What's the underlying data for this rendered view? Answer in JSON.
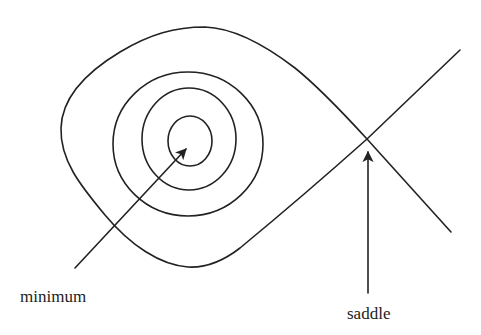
{
  "diagram": {
    "stroke_color": "#222222",
    "background": "#ffffff",
    "labels": {
      "minimum": "minimum",
      "saddle": "saddle"
    },
    "contours": {
      "separatrix": "teardrop-shaped level set crossing itself at the saddle point",
      "closed_loops": [
        {
          "name": "outer-ring",
          "cx": 188,
          "cy": 144,
          "rx": 75,
          "ry": 72
        },
        {
          "name": "middle-ring",
          "cx": 189,
          "cy": 139,
          "rx": 47,
          "ry": 51
        },
        {
          "name": "inner-ring",
          "cx": 190,
          "cy": 141,
          "rx": 22,
          "ry": 25
        }
      ]
    },
    "points": {
      "minimum": {
        "x": 190,
        "y": 141
      },
      "saddle": {
        "x": 367,
        "y": 139
      }
    },
    "arrows": [
      {
        "name": "minimum-arrow",
        "from": [
          75,
          268
        ],
        "to": [
          187,
          148
        ]
      },
      {
        "name": "saddle-arrow",
        "from": [
          368,
          293
        ],
        "to": [
          368,
          151
        ]
      }
    ]
  }
}
